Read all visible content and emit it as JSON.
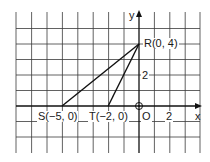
{
  "diagram": {
    "type": "coordinate-plane",
    "grid": {
      "unit_px": 15.4,
      "origin_px": [
        139,
        106
      ],
      "x_range": [
        -8,
        4
      ],
      "y_range": [
        -3,
        6
      ]
    },
    "axes": {
      "x_label": "x",
      "y_label": "y",
      "origin_label": "O",
      "x_tick_label": "2",
      "y_tick_label": "2"
    },
    "points": [
      {
        "id": "R",
        "label": "R(0, 4)",
        "x": 0,
        "y": 4
      },
      {
        "id": "S",
        "label": "S(−5, 0)",
        "x": -5,
        "y": 0
      },
      {
        "id": "T",
        "label": "T(−2, 0)",
        "x": -2,
        "y": 0
      }
    ],
    "segments": [
      [
        "S",
        "R"
      ],
      [
        "T",
        "R"
      ]
    ],
    "colors": {
      "grid": "#2a2a2a",
      "line": "#111111",
      "text": "#1a1a1a"
    }
  }
}
